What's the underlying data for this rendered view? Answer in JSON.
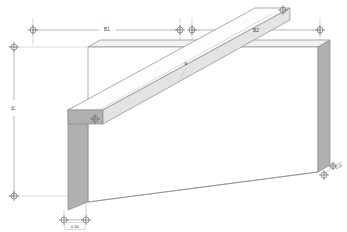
{
  "drawing": {
    "title": "Wall with diagonal beam - axonometric view",
    "background_color": "#ffffff",
    "line_color": "#8a8a8a",
    "dim_line_color": "#9a9a9a",
    "text_color": "#3c3c3c",
    "face_light": "#fcfcfc",
    "face_mid": "#e8e8e8",
    "face_dark": "#b4b4b4",
    "face_edge": "#a8a8a8"
  },
  "dimensions": {
    "top_left": {
      "label": "B1",
      "x": 107,
      "y": 30
    },
    "top_right": {
      "label": "B2",
      "x": 256,
      "y": 32
    },
    "left_vertical": {
      "label": "H",
      "x": 14,
      "y": 108
    },
    "bottom_thickness": {
      "label": "0.40",
      "x": 75,
      "y": 226
    },
    "beam_center": {
      "label": "B",
      "x": 186,
      "y": 65
    },
    "corner_note": {
      "label": "0.28",
      "x": 336,
      "y": 168
    }
  },
  "markers": {
    "vertex_icon": "vertex-cross-circle",
    "count": 9
  },
  "geometry": {
    "wall": {
      "name": "wall-panel",
      "top_front": "88,47 318,47",
      "top_back": "100,40 330,40"
    },
    "beam": {
      "name": "diagonal-beam",
      "start": "72,122",
      "end": "290,10"
    },
    "left_post": {
      "name": "left-end-slab",
      "x": 68,
      "y": 103,
      "w": 20,
      "h": 100
    },
    "right_post": {
      "name": "right-end-slab",
      "x": 307,
      "y": 43,
      "w": 14,
      "h": 127
    }
  }
}
